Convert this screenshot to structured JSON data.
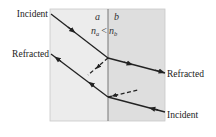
{
  "diagram": {
    "type": "refraction-ray-diagram",
    "media": {
      "left": {
        "label": "a",
        "fill": "#ececec"
      },
      "right": {
        "label": "b",
        "fill": "#dedede"
      }
    },
    "relation": {
      "n_left": "n",
      "sub_left": "a",
      "symbol": "<",
      "n_right": "n",
      "sub_right": "b"
    },
    "labels": {
      "top_left": "Incident",
      "mid_left": "Refracted",
      "mid_right": "Refracted",
      "bottom_right": "Incident"
    },
    "colors": {
      "ray": "#222222",
      "interface": "#777777",
      "border": "#bdbdbd"
    }
  }
}
